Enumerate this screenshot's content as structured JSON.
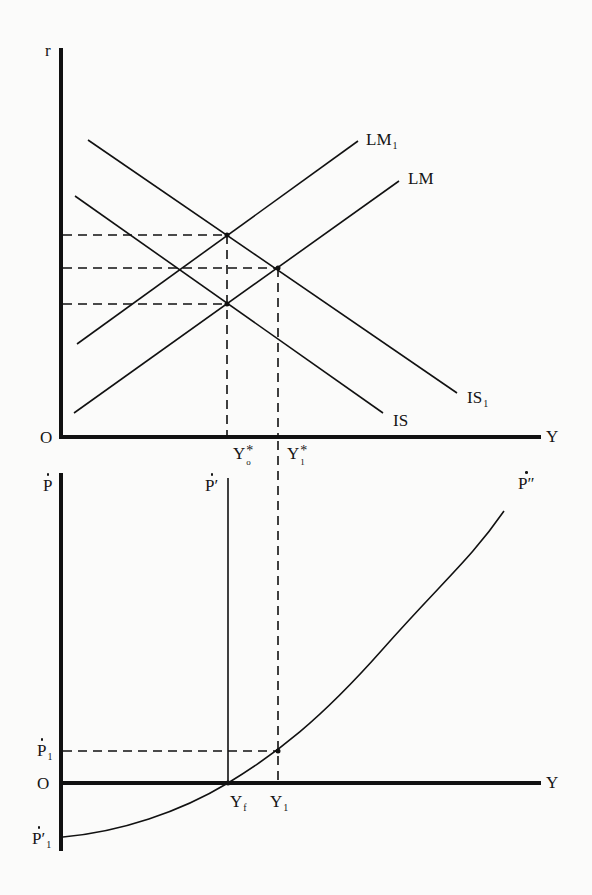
{
  "figure": {
    "top_panel": {
      "title": "IS-LM diagram",
      "y_axis_label": "r",
      "x_axis_label": "Y",
      "origin_label": "O",
      "curves": [
        {
          "name": "LM1",
          "label": "LM",
          "label_sub": "1",
          "type": "upward-sloping line"
        },
        {
          "name": "LM",
          "label": "LM",
          "label_sub": "",
          "type": "upward-sloping line"
        },
        {
          "name": "IS1",
          "label": "IS",
          "label_sub": "1",
          "type": "downward-sloping line"
        },
        {
          "name": "IS",
          "label": "IS",
          "label_sub": "",
          "type": "downward-sloping line"
        }
      ],
      "x_ticks": [
        {
          "label": "Y",
          "sup": "*",
          "sub": "o"
        },
        {
          "label": "Y",
          "sup": "*",
          "sub": "1"
        }
      ],
      "guides": "dashed lines from intersections to r-axis and Y-axis"
    },
    "bottom_panel": {
      "title": "Inflation / output diagram",
      "y_axis_label": "Ṗ",
      "x_axis_label": "Y",
      "origin_label": "O",
      "vertical_line_label": "Ṗ′",
      "curve_label": "Ṗ″",
      "y_ticks": [
        {
          "label": "Ṗ",
          "sub": "1"
        },
        {
          "label": "Ṗ′",
          "sub": "1"
        }
      ],
      "x_ticks": [
        {
          "label": "Y",
          "sub": "f"
        },
        {
          "label": "Y",
          "sub": "1"
        }
      ]
    },
    "labels": {
      "r": "r",
      "O_top": "O",
      "Y_top": "Y",
      "LM1_main": "LM",
      "LM1_sub": "1",
      "LM_main": "LM",
      "IS1_main": "IS",
      "IS1_sub": "1",
      "IS_main": "IS",
      "Y0_main": "Y",
      "Y0_sup": "*",
      "Y0_sub": "o",
      "Y1s_main": "Y",
      "Y1s_sup": "*",
      "Y1s_sub": "1",
      "Pdot": "P",
      "Pprime": "P′",
      "Pdoubleprime": "P″",
      "P1_main": "P",
      "P1_sub": "1",
      "O_bottom": "O",
      "Y_bottom": "Y",
      "Yf_main": "Y",
      "Yf_sub": "f",
      "Y1_main": "Y",
      "Y1_sub": "1",
      "Pprime1_main": "P′",
      "Pprime1_sub": "1"
    }
  }
}
